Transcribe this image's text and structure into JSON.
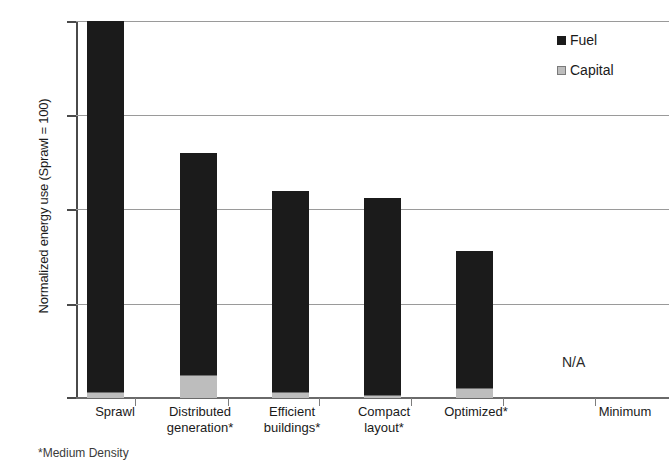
{
  "chart_data": {
    "type": "bar",
    "stacked": true,
    "title": "",
    "xlabel": "",
    "ylabel": "Normalized energy use (Sprawl = 100)",
    "ylim": [
      0,
      100
    ],
    "yticks": [
      "0",
      "25",
      "50",
      "75",
      "100"
    ],
    "grid": true,
    "legend_position": "top-right",
    "categories": [
      "Sprawl",
      "Distributed generation*",
      "Efficient buildings*",
      "Compact layout*",
      "Optimized*",
      "Minimum"
    ],
    "category_lines": [
      {
        "line1": "Sprawl",
        "line2": ""
      },
      {
        "line1": "Distributed",
        "line2": "generation*"
      },
      {
        "line1": "Efficient",
        "line2": "buildings*"
      },
      {
        "line1": "Compact",
        "line2": "layout*"
      },
      {
        "line1": "Optimized*",
        "line2": ""
      },
      {
        "line1": "Minimum",
        "line2": ""
      }
    ],
    "series": [
      {
        "name": "Capital",
        "color": "#bdbdbd",
        "values": [
          1.5,
          6.0,
          1.6,
          0.8,
          2.6,
          null
        ]
      },
      {
        "name": "Fuel",
        "color": "#1b1b1b",
        "values": [
          98.5,
          59.0,
          53.4,
          52.2,
          36.4,
          null
        ]
      }
    ],
    "totals": [
      100,
      65,
      55,
      53,
      39,
      null
    ],
    "annotations": [
      {
        "text": "N/A",
        "category": "Minimum",
        "value": 10
      }
    ]
  },
  "legend": {
    "items": [
      {
        "label": "Fuel",
        "swatch": "fuel-swatch",
        "color": "#1b1b1b"
      },
      {
        "label": "Capital",
        "swatch": "capital-swatch",
        "color": "#bdbdbd"
      }
    ]
  },
  "axes": {
    "y_title": "Normalized energy use (Sprawl = 100)",
    "y_tick_labels": [
      "100",
      "75",
      "50",
      "25",
      "0"
    ]
  },
  "footnote": "*Medium Density"
}
